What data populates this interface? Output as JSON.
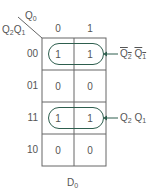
{
  "map": {
    "var_col": "Q",
    "var_col_sub": "0",
    "var_row_a": "Q",
    "var_row_a_sub": "2",
    "var_row_b": "Q",
    "var_row_b_sub": "1",
    "col_labels": [
      "0",
      "1"
    ],
    "row_labels": [
      "00",
      "01",
      "11",
      "10"
    ],
    "cells": [
      [
        "1",
        "1"
      ],
      [
        "0",
        "0"
      ],
      [
        "1",
        "1"
      ],
      [
        "0",
        "0"
      ]
    ],
    "title": "D",
    "title_sub": "0"
  },
  "groups": [
    {
      "row": "00",
      "term_a": "Q",
      "term_a_sub": "2",
      "term_b": "Q",
      "term_b_sub": "1",
      "complemented": true
    },
    {
      "row": "11",
      "term_a": "Q",
      "term_a_sub": "2",
      "term_b": "Q",
      "term_b_sub": "1",
      "complemented": false
    }
  ],
  "colors": {
    "loop": "#2e5e4e",
    "grid": "#666666",
    "text": "#555555"
  }
}
